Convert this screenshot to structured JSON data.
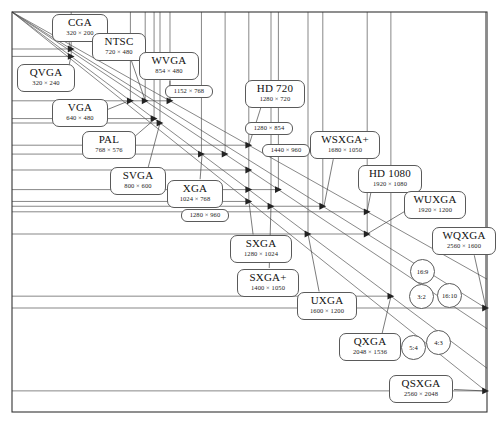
{
  "figure": {
    "frame": {
      "left": 12,
      "top": 12,
      "right": 487,
      "bottom": 412
    },
    "origin": {
      "x": 12,
      "y": 12
    },
    "scale_px_per_unit": 0.185,
    "stroke_color": "#555555",
    "background": "#ffffff"
  },
  "chart_data": {
    "type": "scatter",
    "xlabel": "Width (pixels)",
    "ylabel": "Height (pixels)",
    "grid": true,
    "legend_position": "none",
    "xlim": [
      0,
      2560
    ],
    "ylim": [
      0,
      2048
    ],
    "note": "Each resolution is a point; horizontal rules mark heights, vertical rules mark widths, and rays from the origin mark aspect ratios.",
    "points": [
      {
        "name": "CGA",
        "width": 320,
        "height": 200,
        "label": "320 × 200",
        "ratio": "16:10"
      },
      {
        "name": "QVGA",
        "width": 320,
        "height": 240,
        "label": "320 × 240",
        "ratio": "4:3"
      },
      {
        "name": "VGA",
        "width": 640,
        "height": 480,
        "label": "640 × 480",
        "ratio": "4:3"
      },
      {
        "name": "NTSC",
        "width": 720,
        "height": 480,
        "label": "720 × 480",
        "ratio": "3:2"
      },
      {
        "name": "PAL",
        "width": 768,
        "height": 576,
        "label": "768 × 576",
        "ratio": "4:3"
      },
      {
        "name": "SVGA",
        "width": 800,
        "height": 600,
        "label": "800 × 600",
        "ratio": "4:3"
      },
      {
        "name": "WVGA",
        "width": 854,
        "height": 480,
        "label": "854 × 480",
        "ratio": "16:9"
      },
      {
        "name": "XGA",
        "width": 1024,
        "height": 768,
        "label": "1024 × 768",
        "ratio": "4:3"
      },
      {
        "name": "",
        "width": 1152,
        "height": 768,
        "label": "1152 × 768",
        "ratio": "3:2"
      },
      {
        "name": "HD 720",
        "width": 1280,
        "height": 720,
        "label": "1280 × 720",
        "ratio": "16:9"
      },
      {
        "name": "",
        "width": 1280,
        "height": 854,
        "label": "1280 × 854",
        "ratio": "3:2"
      },
      {
        "name": "",
        "width": 1280,
        "height": 960,
        "label": "1280 × 960",
        "ratio": "4:3"
      },
      {
        "name": "SXGA",
        "width": 1280,
        "height": 1024,
        "label": "1280 × 1024",
        "ratio": "5:4"
      },
      {
        "name": "SXGA+",
        "width": 1400,
        "height": 1050,
        "label": "1400 × 1050",
        "ratio": "4:3"
      },
      {
        "name": "",
        "width": 1440,
        "height": 960,
        "label": "1440 × 960",
        "ratio": "3:2"
      },
      {
        "name": "UXGA",
        "width": 1600,
        "height": 1200,
        "label": "1600 × 1200",
        "ratio": "4:3"
      },
      {
        "name": "WSXGA+",
        "width": 1680,
        "height": 1050,
        "label": "1680 × 1050",
        "ratio": "16:10"
      },
      {
        "name": "HD 1080",
        "width": 1920,
        "height": 1080,
        "label": "1920 × 1080",
        "ratio": "16:9"
      },
      {
        "name": "WUXGA",
        "width": 1920,
        "height": 1200,
        "label": "1920 × 1200",
        "ratio": "16:10"
      },
      {
        "name": "QXGA",
        "width": 2048,
        "height": 1536,
        "label": "2048 × 1536",
        "ratio": "4:3"
      },
      {
        "name": "WQXGA",
        "width": 2560,
        "height": 1600,
        "label": "2560 × 1600",
        "ratio": "16:10"
      },
      {
        "name": "QSXGA",
        "width": 2560,
        "height": 2048,
        "label": "2560 × 2048",
        "ratio": "5:4"
      }
    ],
    "aspect_ratios": [
      {
        "label": "16:9",
        "w": 16,
        "h": 9
      },
      {
        "label": "16:10",
        "w": 16,
        "h": 10
      },
      {
        "label": "3:2",
        "w": 3,
        "h": 2
      },
      {
        "label": "4:3",
        "w": 4,
        "h": 3
      },
      {
        "label": "5:4",
        "w": 5,
        "h": 4
      }
    ]
  },
  "labels": [
    {
      "id": "cga",
      "name": "CGA",
      "res": "320 × 200",
      "x": 52,
      "y": 14,
      "w": 56,
      "h": 28,
      "anchor_x": 71,
      "anchor_y": 50
    },
    {
      "id": "ntsc",
      "name": "NTSC",
      "res": "720 × 480",
      "x": 92,
      "y": 33,
      "w": 54,
      "h": 28,
      "anchor_x": 145,
      "anchor_y": 100
    },
    {
      "id": "wvga",
      "name": "WVGA",
      "res": "854 × 480",
      "x": 139,
      "y": 52,
      "w": 60,
      "h": 28,
      "anchor_x": 170,
      "anchor_y": 100
    },
    {
      "id": "qvga",
      "name": "QVGA",
      "res": "320 × 240",
      "x": 17,
      "y": 64,
      "w": 58,
      "h": 28,
      "anchor_x": 71,
      "anchor_y": 56
    },
    {
      "id": "hd720",
      "name": "HD 720",
      "res": "1280 × 720",
      "x": 245,
      "y": 80,
      "w": 60,
      "h": 28,
      "anchor_x": 249,
      "anchor_y": 145
    },
    {
      "id": "vga",
      "name": "VGA",
      "res": "640 × 480",
      "x": 52,
      "y": 99,
      "w": 56,
      "h": 28,
      "anchor_x": 131,
      "anchor_y": 100
    },
    {
      "id": "pal",
      "name": "PAL",
      "res": "768 × 576",
      "x": 82,
      "y": 131,
      "w": 54,
      "h": 28,
      "anchor_x": 155,
      "anchor_y": 119
    },
    {
      "id": "wsxga",
      "name": "WSXGA+",
      "res": "1680 × 1050",
      "x": 310,
      "y": 131,
      "w": 70,
      "h": 28,
      "anchor_x": 324,
      "anchor_y": 206
    },
    {
      "id": "hd1080",
      "name": "HD 1080",
      "res": "1920 × 1080",
      "x": 358,
      "y": 165,
      "w": 64,
      "h": 28,
      "anchor_x": 367,
      "anchor_y": 212
    },
    {
      "id": "svga",
      "name": "SVGA",
      "res": "800 × 600",
      "x": 110,
      "y": 167,
      "w": 56,
      "h": 28,
      "anchor_x": 160,
      "anchor_y": 123
    },
    {
      "id": "xga",
      "name": "XGA",
      "res": "1024 × 768",
      "x": 167,
      "y": 180,
      "w": 56,
      "h": 28,
      "anchor_x": 202,
      "anchor_y": 155
    },
    {
      "id": "wuxga",
      "name": "WUXGA",
      "res": "1920 × 1200",
      "x": 404,
      "y": 191,
      "w": 62,
      "h": 28,
      "anchor_x": 367,
      "anchor_y": 234
    },
    {
      "id": "wqxga",
      "name": "WQXGA",
      "res": "2560 × 1600",
      "x": 432,
      "y": 227,
      "w": 64,
      "h": 28,
      "anchor_x": 486,
      "anchor_y": 308
    },
    {
      "id": "sxga",
      "name": "SXGA",
      "res": "1280 × 1024",
      "x": 230,
      "y": 235,
      "w": 62,
      "h": 28,
      "anchor_x": 249,
      "anchor_y": 202
    },
    {
      "id": "sxgap",
      "name": "SXGA+",
      "res": "1400 × 1050",
      "x": 237,
      "y": 269,
      "w": 62,
      "h": 28,
      "anchor_x": 271,
      "anchor_y": 206
    },
    {
      "id": "uxga",
      "name": "UXGA",
      "res": "1600 × 1200",
      "x": 297,
      "y": 292,
      "w": 60,
      "h": 28,
      "anchor_x": 308,
      "anchor_y": 234
    },
    {
      "id": "qxga",
      "name": "QXGA",
      "res": "2048 × 1536",
      "x": 339,
      "y": 333,
      "w": 62,
      "h": 28,
      "anchor_x": 391,
      "anchor_y": 296
    },
    {
      "id": "qsxga",
      "name": "QSXGA",
      "res": "2560 × 2048",
      "x": 389,
      "y": 375,
      "w": 64,
      "h": 28,
      "anchor_x": 486,
      "anchor_y": 391
    }
  ],
  "small_labels": [
    {
      "id": "r1152x768",
      "res": "1152 × 768",
      "x": 165,
      "y": 85,
      "w": 48,
      "h": 13
    },
    {
      "id": "r1280x854",
      "res": "1280 × 854",
      "x": 245,
      "y": 122,
      "w": 48,
      "h": 13
    },
    {
      "id": "r1440x960",
      "res": "1440 × 960",
      "x": 262,
      "y": 144,
      "w": 48,
      "h": 13
    },
    {
      "id": "r1280x960",
      "res": "1280 × 960",
      "x": 181,
      "y": 209,
      "w": 48,
      "h": 13
    }
  ],
  "ratio_bubbles": [
    {
      "id": "r169",
      "label": "16:9",
      "x": 410,
      "y": 259,
      "d": 25
    },
    {
      "id": "r1610",
      "label": "16:10",
      "x": 437,
      "y": 283,
      "d": 25
    },
    {
      "id": "r32",
      "label": "3:2",
      "x": 409,
      "y": 284,
      "d": 25
    },
    {
      "id": "r54",
      "label": "5:4",
      "x": 401,
      "y": 335,
      "d": 25
    },
    {
      "id": "r43",
      "label": "4:3",
      "x": 426,
      "y": 330,
      "d": 25
    }
  ]
}
